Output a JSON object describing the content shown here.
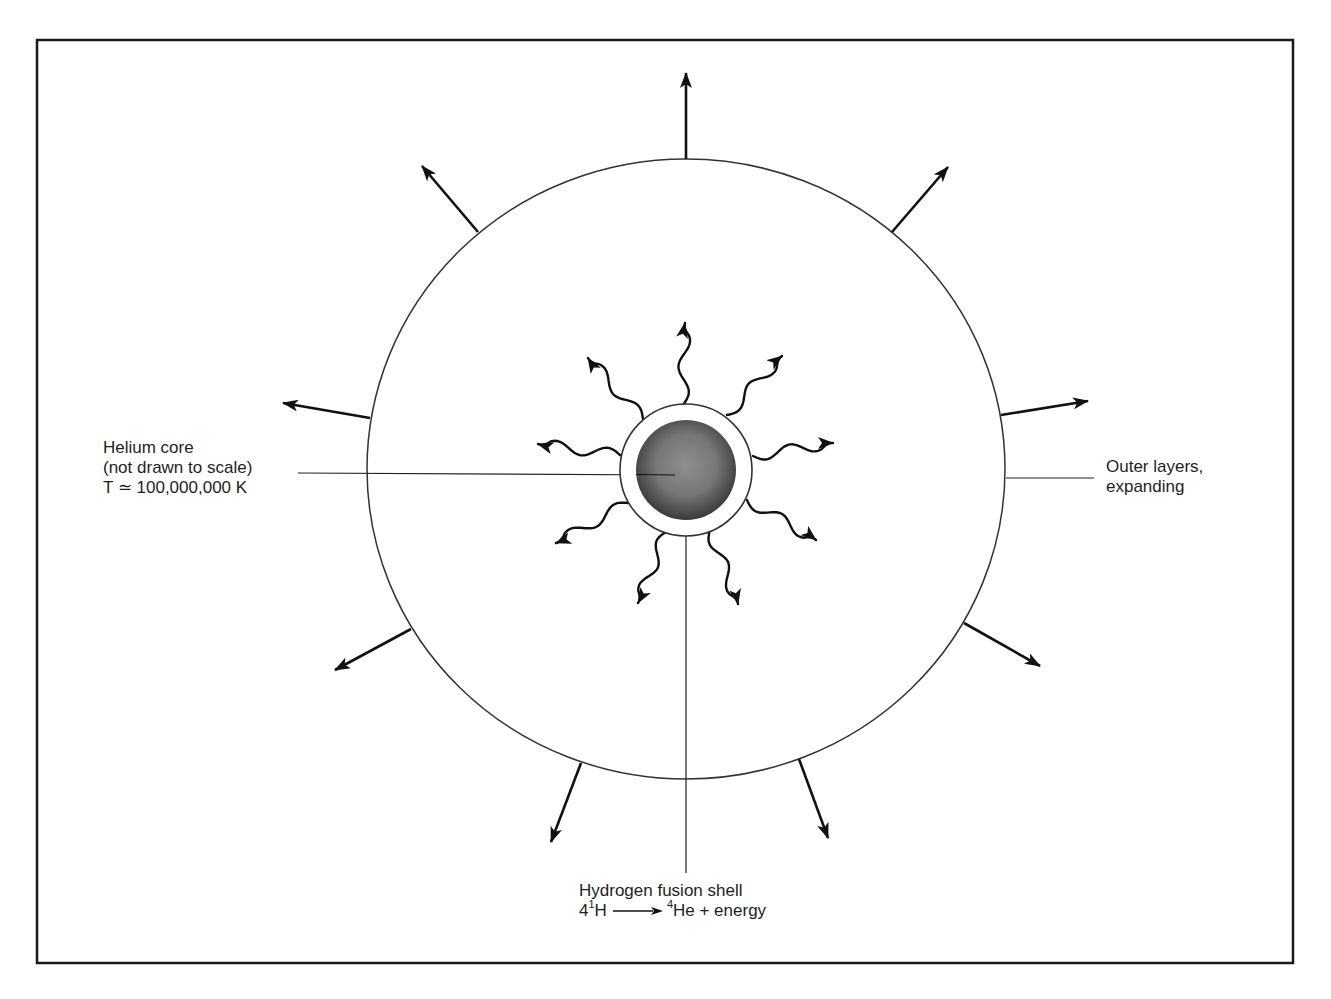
{
  "figure": {
    "frame": {
      "x": 37,
      "y": 40,
      "width": 1256,
      "height": 923,
      "stroke": "#1a1a1a"
    },
    "star_outer": {
      "cx": 686,
      "cy": 469,
      "rx": 319,
      "ry": 310,
      "stroke": "#333333"
    },
    "fusion_shell": {
      "cx": 686,
      "cy": 470,
      "r": 66,
      "fill": "#ffffff",
      "stroke": "#333333"
    },
    "helium_core": {
      "cx": 686,
      "cy": 470,
      "r": 50,
      "fill_center": "#8a8a8a",
      "fill_edge": "#3a3a3a"
    },
    "outer_arrows": [
      {
        "x1": 686,
        "y1": 159,
        "x2": 686,
        "y2": 73
      },
      {
        "x1": 892,
        "y1": 232,
        "x2": 948,
        "y2": 167
      },
      {
        "x1": 1001,
        "y1": 415,
        "x2": 1088,
        "y2": 401
      },
      {
        "x1": 964,
        "y1": 623,
        "x2": 1040,
        "y2": 666
      },
      {
        "x1": 799,
        "y1": 759,
        "x2": 828,
        "y2": 838
      },
      {
        "x1": 581,
        "y1": 763,
        "x2": 551,
        "y2": 842
      },
      {
        "x1": 411,
        "y1": 629,
        "x2": 335,
        "y2": 670
      },
      {
        "x1": 370,
        "y1": 418,
        "x2": 283,
        "y2": 403
      },
      {
        "x1": 478,
        "y1": 232,
        "x2": 422,
        "y2": 166
      }
    ],
    "energy_arrows": [
      {
        "x1": 683,
        "y1": 405,
        "x2": 685,
        "y2": 323
      },
      {
        "x1": 727,
        "y1": 415,
        "x2": 782,
        "y2": 356
      },
      {
        "x1": 753,
        "y1": 456,
        "x2": 833,
        "y2": 443
      },
      {
        "x1": 747,
        "y1": 500,
        "x2": 816,
        "y2": 540
      },
      {
        "x1": 710,
        "y1": 530,
        "x2": 738,
        "y2": 604
      },
      {
        "x1": 666,
        "y1": 532,
        "x2": 638,
        "y2": 603
      },
      {
        "x1": 628,
        "y1": 503,
        "x2": 556,
        "y2": 543
      },
      {
        "x1": 620,
        "y1": 455,
        "x2": 538,
        "y2": 444
      },
      {
        "x1": 643,
        "y1": 419,
        "x2": 588,
        "y2": 358
      }
    ],
    "leaders": {
      "core": {
        "x1": 298,
        "y1": 473,
        "x2": 675,
        "y2": 475
      },
      "outer": {
        "x1": 1006,
        "y1": 478,
        "x2": 1094,
        "y2": 478
      },
      "shell": {
        "x1": 686,
        "y1": 536,
        "x2": 686,
        "y2": 873
      }
    }
  },
  "labels": {
    "core": {
      "line1": "Helium core",
      "line2": "(not drawn to scale)",
      "line3": "T ≃ 100,000,000 K"
    },
    "outer": {
      "line1": "Outer layers,",
      "line2": "expanding"
    },
    "shell": {
      "line1": "Hydrogen fusion shell",
      "eq_coef": "4",
      "eq_h_mass": "1",
      "eq_h": "H",
      "eq_he_mass": "4",
      "eq_he": "He + energy"
    }
  }
}
